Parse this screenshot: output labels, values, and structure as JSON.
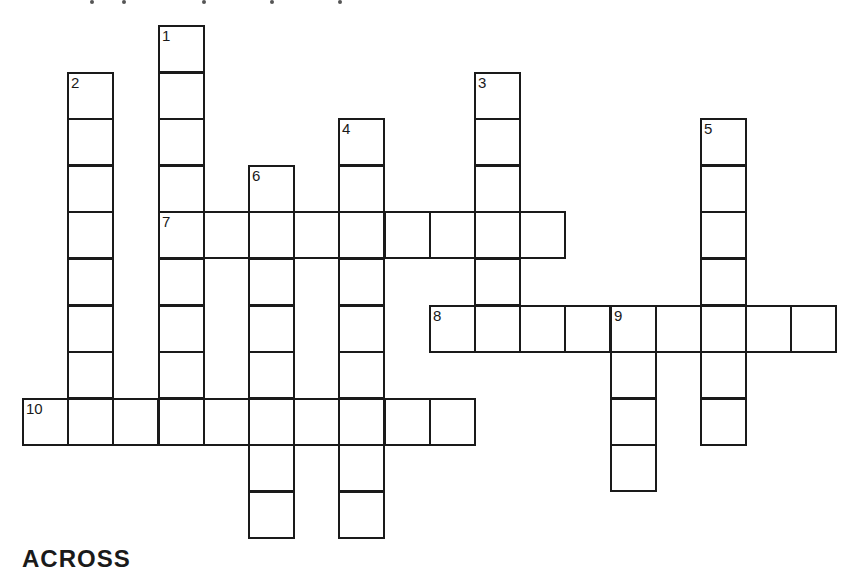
{
  "puzzle": {
    "grid": {
      "origin_x": 22,
      "origin_y": 25,
      "cell_w": 45.2,
      "cell_h": 46.6,
      "line_color": "#1a1a1a",
      "background": "#ffffff"
    },
    "words": [
      {
        "number": "1",
        "direction": "down",
        "col": 3,
        "row": 0,
        "length": 9
      },
      {
        "number": "2",
        "direction": "down",
        "col": 1,
        "row": 1,
        "length": 8
      },
      {
        "number": "3",
        "direction": "down",
        "col": 10,
        "row": 1,
        "length": 6
      },
      {
        "number": "4",
        "direction": "down",
        "col": 7,
        "row": 2,
        "length": 9
      },
      {
        "number": "5",
        "direction": "down",
        "col": 15,
        "row": 2,
        "length": 7
      },
      {
        "number": "6",
        "direction": "down",
        "col": 5,
        "row": 3,
        "length": 8
      },
      {
        "number": "7",
        "direction": "across",
        "col": 3,
        "row": 4,
        "length": 9
      },
      {
        "number": "8",
        "direction": "across",
        "col": 9,
        "row": 6,
        "length": 9
      },
      {
        "number": "9",
        "direction": "down",
        "col": 13,
        "row": 6,
        "length": 4
      },
      {
        "number": "10",
        "direction": "across",
        "col": 0,
        "row": 8,
        "length": 10
      }
    ]
  },
  "headings": {
    "across": "ACROSS"
  }
}
